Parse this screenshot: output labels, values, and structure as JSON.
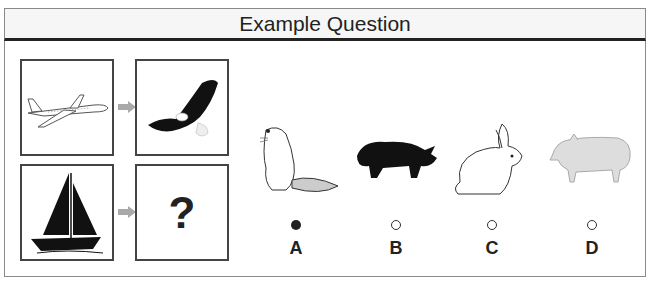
{
  "header": {
    "title": "Example Question"
  },
  "analogy": {
    "pairs": [
      {
        "source": "airplane",
        "target": "eagle"
      },
      {
        "source": "sailboat",
        "target": "?"
      }
    ],
    "unknown_symbol": "?"
  },
  "options": [
    {
      "letter": "A",
      "animal": "beaver",
      "selected": true
    },
    {
      "letter": "B",
      "animal": "rhinoceros",
      "selected": false
    },
    {
      "letter": "C",
      "animal": "rabbit",
      "selected": false
    },
    {
      "letter": "D",
      "animal": "pig",
      "selected": false
    }
  ],
  "colors": {
    "arrow": "#a9a9a9",
    "border": "#444444",
    "header_bg": "#f6f6f6"
  }
}
